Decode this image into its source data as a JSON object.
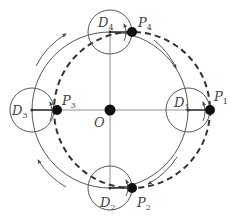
{
  "diagram": {
    "type": "circular-translation-motion",
    "center": {
      "label": "O"
    },
    "colors": {
      "line": "#555555",
      "dashed": "#333333",
      "dot": "#111111",
      "background": "#ffffff"
    },
    "positions": [
      {
        "disc": "D",
        "disc_sub": "1",
        "point": "P",
        "point_sub": "1"
      },
      {
        "disc": "D",
        "disc_sub": "2",
        "point": "P",
        "point_sub": "2"
      },
      {
        "disc": "D",
        "disc_sub": "3",
        "point": "P",
        "point_sub": "3"
      },
      {
        "disc": "D",
        "disc_sub": "4",
        "point": "P",
        "point_sub": "4"
      }
    ],
    "paths": {
      "solid_circle": "path of disc centers D around O",
      "dashed_circle": "path of point P"
    },
    "motion_direction": "clockwise"
  }
}
